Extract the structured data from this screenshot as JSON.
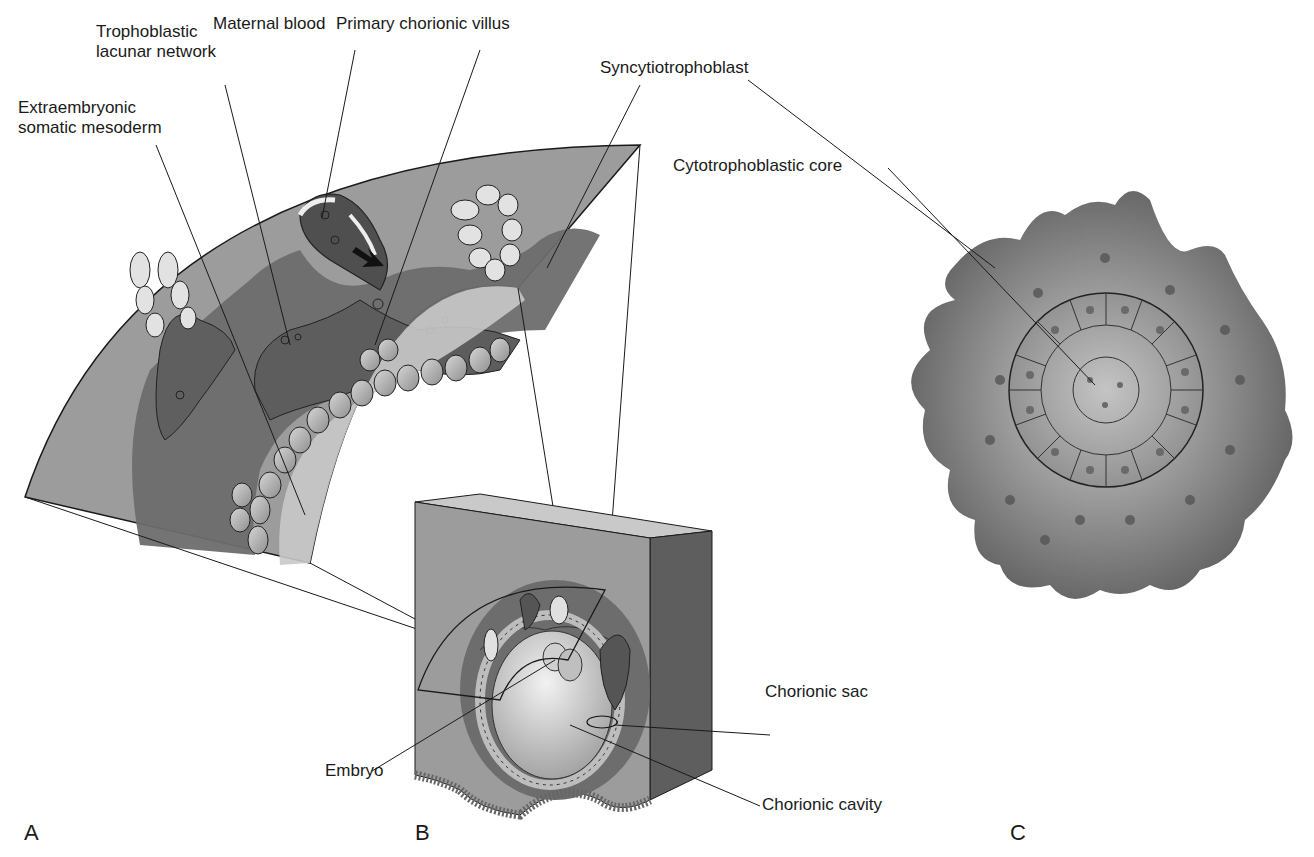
{
  "figure": {
    "panels": [
      {
        "id": "A",
        "letter": "A"
      },
      {
        "id": "B",
        "letter": "B"
      },
      {
        "id": "C",
        "letter": "C"
      }
    ],
    "labels": {
      "extraembryonic_line1": "Extraembryonic",
      "extraembryonic_line2": "somatic mesoderm",
      "trophoblastic_line1": "Trophoblastic",
      "trophoblastic_line2": "lacunar network",
      "maternal_blood": "Maternal blood",
      "primary_villus": "Primary chorionic villus",
      "syncytiotrophoblast": "Syncytiotrophoblast",
      "cytotrophoblastic_core": "Cytotrophoblastic core",
      "chorionic_sac": "Chorionic sac",
      "embryo": "Embryo",
      "chorionic_cavity": "Chorionic cavity"
    },
    "colors": {
      "background": "#ffffff",
      "endometrium": "#9a9a9a",
      "syncytio_dark": "#6a6a6a",
      "cyto_cells": "#b4b4b4",
      "gland_cells": "#e0e0e0",
      "mesoderm": "#c8c8c8",
      "block_side": "#5e5e5e",
      "block_top": "#c9c9c9",
      "leader_line": "#1a1a1a"
    }
  }
}
